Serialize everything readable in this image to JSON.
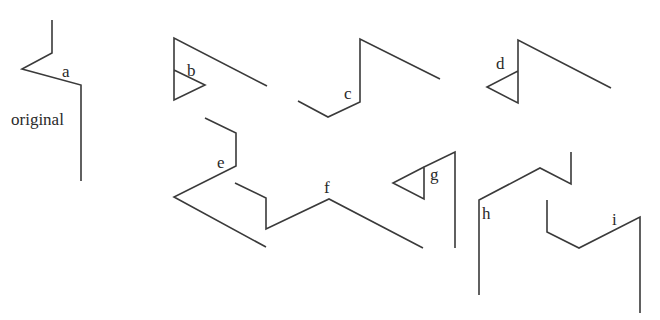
{
  "diagram": {
    "stroke_color": "#3a3a3a",
    "figures": [
      {
        "id": "a",
        "label": "a",
        "label_pos": [
          62,
          77
        ],
        "extra_label": "original",
        "extra_label_pos": [
          11,
          125
        ],
        "paths": [
          "52,20 52,53 22,69 81,85 81,181"
        ]
      },
      {
        "id": "b",
        "label": "b",
        "label_pos": [
          187,
          76
        ],
        "paths": [
          "267,86 174,38 174,100 205,85 174,70"
        ]
      },
      {
        "id": "c",
        "label": "c",
        "label_pos": [
          344,
          99
        ],
        "paths": [
          "298,101 328,117 360,102 360,39 440,79"
        ]
      },
      {
        "id": "d",
        "label": "d",
        "label_pos": [
          496,
          69
        ],
        "paths": [
          "611,88 518,40 518,103 487,87 518,71"
        ]
      },
      {
        "id": "e",
        "label": "e",
        "label_pos": [
          217,
          168
        ],
        "paths": [
          "205,118 236,133 236,166 174,197 266,247"
        ]
      },
      {
        "id": "f",
        "label": "f",
        "label_pos": [
          324,
          193
        ],
        "paths": [
          "235,183 266,198 266,229 329,199 423,248"
        ]
      },
      {
        "id": "g",
        "label": "g",
        "label_pos": [
          430,
          180
        ],
        "paths": [
          "455,248 455,152 424,167 424,199 393,183 424,167"
        ]
      },
      {
        "id": "h",
        "label": "h",
        "label_pos": [
          482,
          219
        ],
        "paths": [
          "479,295 479,200 540,168 571,184 571,152"
        ]
      },
      {
        "id": "i",
        "label": "i",
        "label_pos": [
          612,
          225
        ],
        "paths": [
          "547,200 547,232 579,248 640,217 640,313"
        ]
      }
    ]
  }
}
